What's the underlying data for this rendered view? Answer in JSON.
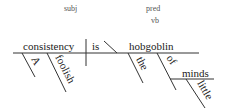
{
  "diagram": {
    "type": "sentence-diagram",
    "sentence": "A foolish consistency is the hobgoblin of little minds",
    "labels": {
      "subj": "subj",
      "pred": "pred",
      "vb": "vb"
    },
    "subject": "consistency",
    "verb": "is",
    "predicate_noun": "hobgoblin",
    "modifiers": {
      "subject_1": "A",
      "subject_2": "foolish",
      "predicate_1": "the",
      "preposition": "of",
      "prep_object": "minds",
      "prep_object_modifier": "little"
    },
    "colors": {
      "line": "#333333",
      "text": "#222222",
      "label": "#555555"
    }
  }
}
